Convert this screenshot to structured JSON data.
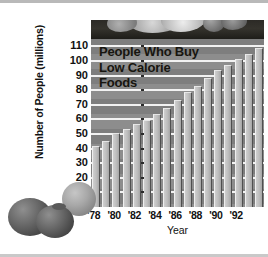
{
  "figure": {
    "name": "bar-chart-people-who-buy-low-calorie-foods",
    "title_lines": [
      "People Who Buy",
      "Low Calorie",
      "Foods"
    ],
    "decorations": {
      "top_band": "vegetable-produce-art",
      "bottom_left": "tomatoes-art",
      "left_circle": "onion-art"
    }
  },
  "chart_data": {
    "type": "bar",
    "title": "People Who Buy Low Calorie Foods",
    "xlabel": "Year",
    "ylabel": "Number of People (millions)",
    "ylim": [
      0,
      115
    ],
    "ytick_values": [
      10,
      20,
      30,
      40,
      50,
      60,
      70,
      80,
      90,
      100,
      110
    ],
    "ytick_labels": [
      "10",
      "20",
      "30",
      "40",
      "50",
      "60",
      "70",
      "80",
      "90",
      "100",
      "110"
    ],
    "grid": true,
    "legend": "none",
    "categories": [
      "1978",
      "1979",
      "1980",
      "1981",
      "1982",
      "1983",
      "1984",
      "1985",
      "1986",
      "1987",
      "1988",
      "1989",
      "1990",
      "1991",
      "1992",
      "1993"
    ],
    "xtick_labels": [
      "'78",
      "'80",
      "'82",
      "'84",
      "'86",
      "'88",
      "'90",
      "'92"
    ],
    "xtick_categories": [
      "1978",
      "1980",
      "1982",
      "1984",
      "1986",
      "1988",
      "1990",
      "1992"
    ],
    "values": [
      42,
      45.5,
      50.5,
      53.5,
      56.5,
      59.5,
      63.5,
      68,
      73.5,
      79,
      83,
      88.5,
      93.5,
      97.5,
      101,
      105
    ],
    "last_value": 109,
    "units": "millions of people"
  },
  "colors": {
    "plot_background": "#8d8d8d",
    "band_shade": "#7e7e7e",
    "gridline": "#f2f2f2",
    "bar_face": "#bdbdbd",
    "bar_shadow": "#4f4f4f",
    "header_band": "#2c2a26",
    "text": "#111111"
  }
}
